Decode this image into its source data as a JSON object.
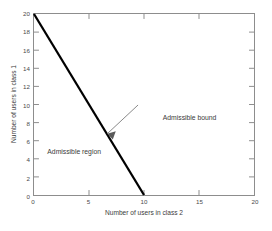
{
  "chart_data": {
    "type": "line",
    "title": "",
    "xlabel": "Number of users in class 2",
    "ylabel": "Number of users in class 1",
    "xlim": [
      0,
      20
    ],
    "ylim": [
      0,
      20
    ],
    "xticks": [
      0,
      5,
      10,
      15,
      20
    ],
    "yticks": [
      0,
      2,
      4,
      6,
      8,
      10,
      12,
      14,
      16,
      18,
      20
    ],
    "xticklabels": [
      "0",
      "5",
      "10",
      "15",
      "20"
    ],
    "yticklabels": [
      "0",
      "2",
      "4",
      "6",
      "8",
      "10",
      "12",
      "14",
      "16",
      "18",
      "20"
    ],
    "grid": false,
    "legend": null,
    "series": [
      {
        "name": "Admissible bound",
        "type": "line",
        "color": "#000000",
        "linewidth": 2,
        "x": [
          0,
          10
        ],
        "y": [
          20,
          0
        ]
      }
    ],
    "annotations": [
      {
        "id": "admissible-bound",
        "text": "Admissible bound",
        "text_xy": [
          11.6,
          8.6
        ],
        "arrow_to_xy": [
          6.5,
          7.0
        ],
        "arrow": true,
        "color": "#3a3a3a"
      },
      {
        "id": "admissible-region",
        "text": "Admissible region",
        "text_xy": [
          1.2,
          4.9
        ],
        "arrow": false,
        "color": "#3a3a3a"
      }
    ]
  },
  "axes": {
    "frame_color": "#8d8d8d",
    "tick_color": "#8d8d8d",
    "background": "#ffffff"
  }
}
